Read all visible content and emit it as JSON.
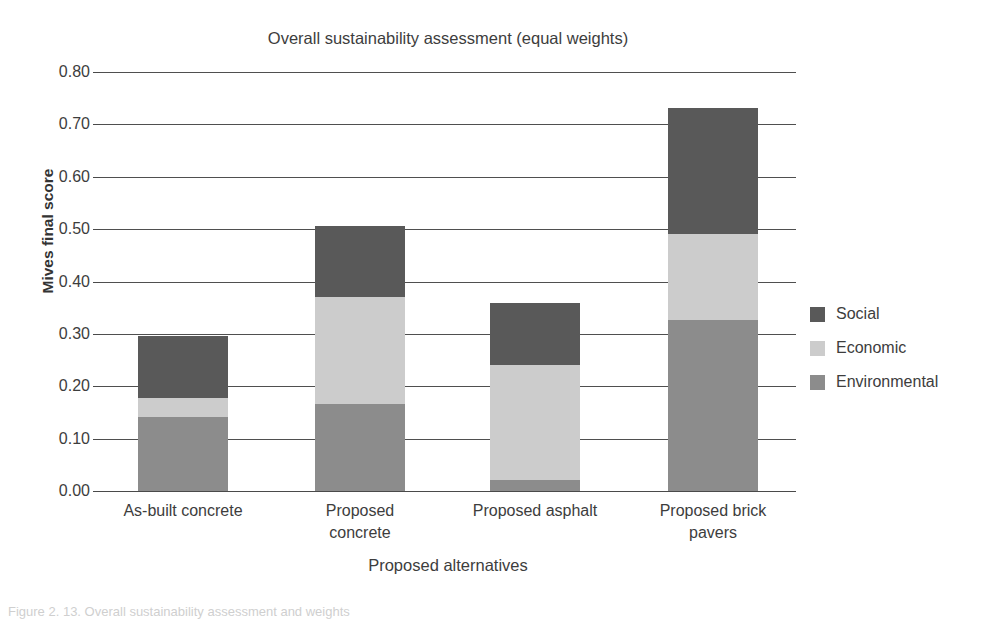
{
  "chart_data": {
    "type": "bar",
    "subtype": "stacked-vertical",
    "title": "Overall sustainability assessment (equal weights)",
    "xlabel": "Proposed alternatives",
    "ylabel": "Mives final score",
    "categories": [
      "As-built concrete",
      "Proposed concrete",
      "Proposed asphalt",
      "Proposed brick pavers"
    ],
    "category_lines": [
      [
        "As-built concrete"
      ],
      [
        "Proposed",
        "concrete"
      ],
      [
        "Proposed asphalt"
      ],
      [
        "Proposed brick",
        "pavers"
      ]
    ],
    "series": [
      {
        "name": "Environmental",
        "color": "#8c8c8c",
        "values": [
          0.141,
          0.166,
          0.021,
          0.326
        ]
      },
      {
        "name": "Economic",
        "color": "#cccccc",
        "values": [
          0.037,
          0.205,
          0.22,
          0.164
        ]
      },
      {
        "name": "Social",
        "color": "#595959",
        "values": [
          0.118,
          0.135,
          0.118,
          0.241
        ]
      }
    ],
    "stack_order_bottom_to_top": [
      "Environmental",
      "Economic",
      "Social"
    ],
    "totals": [
      0.296,
      0.506,
      0.359,
      0.731
    ],
    "ylim": [
      0.0,
      0.8
    ],
    "ytick_step": 0.1,
    "yticks": [
      "0.80",
      "0.70",
      "0.60",
      "0.50",
      "0.40",
      "0.30",
      "0.20",
      "0.10",
      "0.00"
    ],
    "ytick_values": [
      0.8,
      0.7,
      0.6,
      0.5,
      0.4,
      0.3,
      0.2,
      0.1,
      0.0
    ],
    "grid": "horizontal",
    "legend_position": "right",
    "legend_entries": [
      {
        "label": "Social",
        "color": "#595959"
      },
      {
        "label": "Economic",
        "color": "#cccccc"
      },
      {
        "label": "Environmental",
        "color": "#8c8c8c"
      }
    ]
  },
  "caption": {
    "text": "Figure 2. 13. Overall sustainability assessment and weights"
  }
}
